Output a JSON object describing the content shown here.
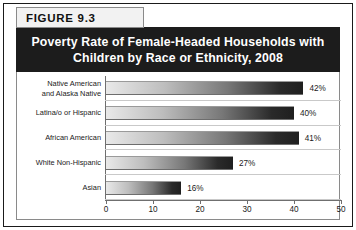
{
  "figure": {
    "tab_label": "FIGURE  9.3",
    "title_line1": "Poverty Rate of Female-Headed Households with",
    "title_line2": "Children by Race or Ethnicity, 2008"
  },
  "colors": {
    "frame": "#1a1a1a",
    "banner_bg": "#1c1c1c",
    "banner_text": "#ffffff",
    "tab_bg": "#f2f2f2",
    "axis": "#6f6f6f",
    "bar_light": "#e9e9e9",
    "bar_dark": "#1f1f1f"
  },
  "chart_data": {
    "type": "bar",
    "orientation": "horizontal",
    "title": "Poverty Rate of Female-Headed Households with Children by Race or Ethnicity, 2008",
    "xlabel": "",
    "ylabel": "",
    "categories": [
      "Native American\nand Alaska Native",
      "Latina/o or Hispanic",
      "African American",
      "White Non-Hispanic",
      "Asian"
    ],
    "values": [
      42,
      40,
      41,
      27,
      16
    ],
    "value_labels": [
      "42%",
      "40%",
      "41%",
      "27%",
      "16%"
    ],
    "xlim": [
      0,
      50
    ],
    "xticks": [
      0,
      10,
      20,
      30,
      40,
      50
    ],
    "xtick_labels": [
      "0",
      "10",
      "20",
      "30",
      "40",
      "50"
    ],
    "grid": false,
    "legend": false
  }
}
